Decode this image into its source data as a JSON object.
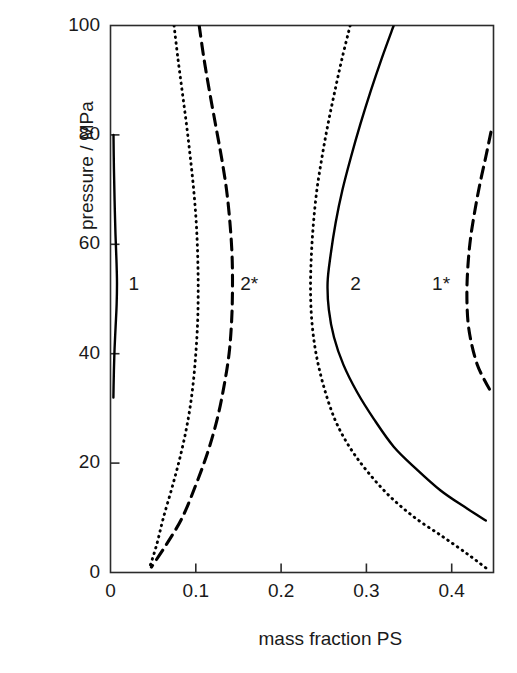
{
  "axes": {
    "x": {
      "title": "mass fraction PS",
      "ticks": [
        {
          "value": 0,
          "label": "0"
        },
        {
          "value": 0.1,
          "label": "0.1"
        },
        {
          "value": 0.2,
          "label": "0.2"
        },
        {
          "value": 0.3,
          "label": "0.3"
        },
        {
          "value": 0.4,
          "label": "0.4"
        }
      ],
      "min": 0,
      "max": 0.449
    },
    "y": {
      "title": "pressure / MPa",
      "ticks": [
        {
          "value": 0,
          "label": "0"
        },
        {
          "value": 20,
          "label": "20"
        },
        {
          "value": 40,
          "label": "40"
        },
        {
          "value": 60,
          "label": "60"
        },
        {
          "value": 80,
          "label": "80"
        },
        {
          "value": 100,
          "label": "100"
        }
      ],
      "min": 0,
      "max": 100
    }
  },
  "annotations": [
    {
      "text": "1",
      "x": 0.021,
      "y": 52.5
    },
    {
      "text": "2*",
      "x": 0.152,
      "y": 52.5
    },
    {
      "text": "2",
      "x": 0.281,
      "y": 52.5
    },
    {
      "text": "1*",
      "x": 0.377,
      "y": 52.5
    }
  ],
  "chart_data": {
    "type": "line",
    "title": "",
    "xlabel": "mass fraction PS",
    "ylabel": "pressure / MPa",
    "xlim": [
      0,
      0.449
    ],
    "ylim": [
      0,
      100
    ],
    "grid": false,
    "legend": "none",
    "annotations": [
      "1",
      "2*",
      "2",
      "1*"
    ],
    "series": [
      {
        "name": "1",
        "style": "solid",
        "color": "#000000",
        "points": [
          [
            0.0035,
            80.0
          ],
          [
            0.004,
            74.0
          ],
          [
            0.0048,
            68.0
          ],
          [
            0.0058,
            62.0
          ],
          [
            0.007,
            57.0
          ],
          [
            0.0076,
            53.0
          ],
          [
            0.0072,
            49.0
          ],
          [
            0.006,
            45.0
          ],
          [
            0.0048,
            41.0
          ],
          [
            0.004,
            37.0
          ],
          [
            0.0036,
            34.0
          ],
          [
            0.0034,
            32.0
          ]
        ]
      },
      {
        "name": "2*",
        "style": "dashed",
        "color": "#000000",
        "points": [
          [
            0.104,
            100.0
          ],
          [
            0.1095,
            94.0
          ],
          [
            0.116,
            88.0
          ],
          [
            0.123,
            82.0
          ],
          [
            0.13,
            76.0
          ],
          [
            0.136,
            70.0
          ],
          [
            0.14,
            64.0
          ],
          [
            0.1425,
            58.0
          ],
          [
            0.143,
            52.0
          ],
          [
            0.142,
            46.0
          ],
          [
            0.139,
            40.0
          ],
          [
            0.133,
            34.0
          ],
          [
            0.125,
            28.0
          ],
          [
            0.114,
            22.0
          ],
          [
            0.1,
            16.0
          ],
          [
            0.084,
            10.0
          ],
          [
            0.065,
            5.0
          ],
          [
            0.048,
            1.0
          ]
        ]
      },
      {
        "name": "2*-inner-dotted",
        "style": "dotted",
        "color": "#000000",
        "points": [
          [
            0.0745,
            100.0
          ],
          [
            0.079,
            94.0
          ],
          [
            0.084,
            88.0
          ],
          [
            0.089,
            82.0
          ],
          [
            0.0935,
            76.0
          ],
          [
            0.0975,
            70.0
          ],
          [
            0.1005,
            64.0
          ],
          [
            0.1022,
            58.0
          ],
          [
            0.1028,
            52.0
          ],
          [
            0.1022,
            46.0
          ],
          [
            0.1,
            40.0
          ],
          [
            0.0965,
            34.0
          ],
          [
            0.091,
            28.0
          ],
          [
            0.083,
            22.0
          ],
          [
            0.073,
            16.0
          ],
          [
            0.062,
            10.0
          ],
          [
            0.054,
            5.0
          ],
          [
            0.046,
            1.0
          ]
        ]
      },
      {
        "name": "2",
        "style": "solid",
        "color": "#000000",
        "points": [
          [
            0.332,
            100.0
          ],
          [
            0.318,
            94.0
          ],
          [
            0.305,
            88.0
          ],
          [
            0.293,
            82.0
          ],
          [
            0.282,
            76.0
          ],
          [
            0.272,
            70.0
          ],
          [
            0.264,
            64.0
          ],
          [
            0.258,
            58.0
          ],
          [
            0.2545,
            53.0
          ],
          [
            0.256,
            48.0
          ],
          [
            0.262,
            43.0
          ],
          [
            0.273,
            38.0
          ],
          [
            0.289,
            33.0
          ],
          [
            0.309,
            28.0
          ],
          [
            0.332,
            23.0
          ],
          [
            0.358,
            19.0
          ],
          [
            0.387,
            15.0
          ],
          [
            0.415,
            12.0
          ],
          [
            0.44,
            9.5
          ]
        ]
      },
      {
        "name": "2-outer-dotted",
        "style": "dotted",
        "color": "#000000",
        "points": [
          [
            0.281,
            100.0
          ],
          [
            0.2715,
            94.0
          ],
          [
            0.263,
            88.0
          ],
          [
            0.255,
            82.0
          ],
          [
            0.248,
            76.0
          ],
          [
            0.242,
            70.0
          ],
          [
            0.238,
            64.0
          ],
          [
            0.2355,
            58.0
          ],
          [
            0.2345,
            52.0
          ],
          [
            0.236,
            46.0
          ],
          [
            0.241,
            40.0
          ],
          [
            0.25,
            34.0
          ],
          [
            0.263,
            28.0
          ],
          [
            0.28,
            23.0
          ],
          [
            0.301,
            18.5
          ],
          [
            0.327,
            14.0
          ],
          [
            0.357,
            10.0
          ],
          [
            0.39,
            6.5
          ],
          [
            0.42,
            3.2
          ],
          [
            0.442,
            0.6
          ]
        ]
      },
      {
        "name": "1*",
        "style": "dashed",
        "color": "#000000",
        "points": [
          [
            0.446,
            80.5
          ],
          [
            0.44,
            76.0
          ],
          [
            0.433,
            71.0
          ],
          [
            0.427,
            66.0
          ],
          [
            0.422,
            61.0
          ],
          [
            0.419,
            56.0
          ],
          [
            0.4178,
            51.0
          ],
          [
            0.419,
            46.0
          ],
          [
            0.423,
            42.0
          ],
          [
            0.43,
            38.0
          ],
          [
            0.439,
            35.0
          ],
          [
            0.448,
            32.5
          ]
        ]
      }
    ]
  }
}
